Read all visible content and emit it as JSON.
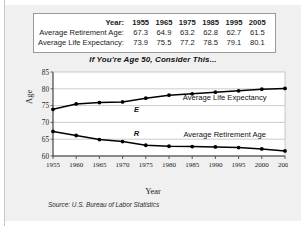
{
  "table": {
    "header_label": "Year:",
    "years": [
      "1955",
      "1965",
      "1975",
      "1985",
      "1995",
      "2005"
    ],
    "rows": [
      {
        "label": "Average Retirement Age:",
        "values": [
          "67.3",
          "64.9",
          "63.2",
          "62.8",
          "62.7",
          "61.5"
        ]
      },
      {
        "label": "Average Life Expectancy:",
        "values": [
          "73.9",
          "75.5",
          "77.2",
          "78.5",
          "79.1",
          "80.1"
        ]
      }
    ]
  },
  "chart_title": "If You're Age 50, Consider This...",
  "source": "Source: U.S. Bureau of Labor Statistics",
  "series_labels": {
    "expectancy_inline": "Average Life Expectancy",
    "retirement_inline": "Average Retirement Age",
    "expectancy_marker": "E",
    "retirement_marker": "R"
  },
  "colors": {
    "line": "#000000",
    "grid": "#c0c0c0",
    "axis": "#4a4a4a",
    "panel": "#f0f0f0",
    "plot_bg": "#ffffff"
  },
  "chart_data": {
    "type": "line",
    "title": "If You're Age 50, Consider This...",
    "xlabel": "Year",
    "ylabel": "Age",
    "xlim": [
      1955,
      2005
    ],
    "ylim": [
      60,
      85
    ],
    "yticks": [
      60,
      65,
      70,
      75,
      80,
      85
    ],
    "ytick_labels": [
      "60",
      "65",
      "70",
      "75",
      "80",
      "85"
    ],
    "xticks": [
      1955,
      1960,
      1965,
      1970,
      1975,
      1980,
      1985,
      1990,
      1995,
      2000,
      2005
    ],
    "xtick_labels": [
      "1955",
      "1960",
      "1965",
      "1970",
      "1975",
      "1980",
      "1985",
      "1990",
      "1995",
      "2000",
      "2005"
    ],
    "grid": "horizontal",
    "legend": "inline-annotations",
    "x": [
      1955,
      1960,
      1965,
      1970,
      1975,
      1980,
      1985,
      1990,
      1995,
      2000,
      2005
    ],
    "series": [
      {
        "name": "Average Life Expectancy",
        "marker": "E",
        "values": [
          73.9,
          75.5,
          75.9,
          76.1,
          77.2,
          78.1,
          78.5,
          79.0,
          79.4,
          79.9,
          80.1
        ]
      },
      {
        "name": "Average Retirement Age",
        "marker": "R",
        "values": [
          67.3,
          66.1,
          64.9,
          64.3,
          63.2,
          62.9,
          62.8,
          62.7,
          62.5,
          62.1,
          61.5
        ]
      }
    ],
    "annotations": [
      {
        "text": "Average Life Expectancy",
        "x": 1992,
        "y": 76.6
      },
      {
        "text": "Average Retirement Age",
        "x": 1992,
        "y": 65.6
      },
      {
        "text": "E",
        "x": 1973,
        "y": 73.1
      },
      {
        "text": "R",
        "x": 1973,
        "y": 65.9
      }
    ],
    "source": "Source: U.S. Bureau of Labor Statistics"
  }
}
